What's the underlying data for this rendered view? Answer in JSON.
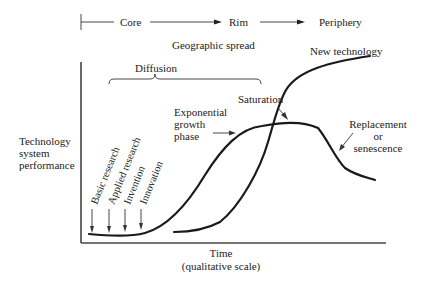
{
  "header": {
    "stages": [
      "Core",
      "Rim",
      "Periphery"
    ],
    "spread_label": "Geographic spread"
  },
  "labels": {
    "diffusion": "Diffusion",
    "new_technology": "New technology",
    "saturation": "Saturation",
    "exponential_growth": [
      "Exponential",
      "growth",
      "phase"
    ],
    "replacement": [
      "Replacement",
      "or",
      "senescence"
    ],
    "y_axis": [
      "Technology",
      "system",
      "performance"
    ],
    "x_axis": [
      "Time",
      "(qualitative scale)"
    ],
    "early_stages": [
      "Basic research",
      "Applied research",
      "Invention",
      "Innovation"
    ]
  },
  "colors": {
    "ink": "#1a1a1a",
    "axis": "#444444",
    "background": "#ffffff"
  }
}
